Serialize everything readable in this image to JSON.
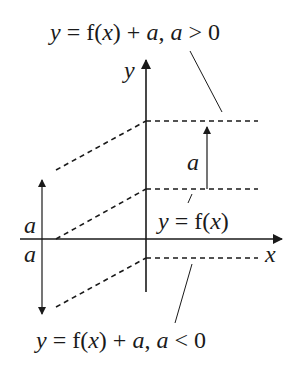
{
  "diagram": {
    "type": "function-transformation",
    "labels": {
      "top_equation": {
        "y": "y",
        "eq": " = f(",
        "x": "x",
        "close": ") + ",
        "a1": "a",
        "comma": ", ",
        "a2": "a",
        "cond": " > 0"
      },
      "bottom_equation": {
        "y": "y",
        "eq": " = f(",
        "x": "x",
        "close": ") + ",
        "a1": "a",
        "comma": ", ",
        "a2": "a",
        "cond": " < 0"
      },
      "base_equation": {
        "y": "y",
        "eq": " = f(",
        "x": "x",
        "close": ")"
      },
      "y_axis": "y",
      "x_axis": "x",
      "shift_up": "a",
      "shift_left_up": "a",
      "shift_left_down": "a"
    },
    "curves": [
      {
        "name": "f(x)+a, a>0",
        "style": "dashed"
      },
      {
        "name": "f(x)",
        "style": "dashed"
      },
      {
        "name": "f(x)+a, a<0",
        "style": "dashed"
      }
    ],
    "colors": {
      "ink": "#1a1a1a",
      "background": "#ffffff"
    }
  }
}
